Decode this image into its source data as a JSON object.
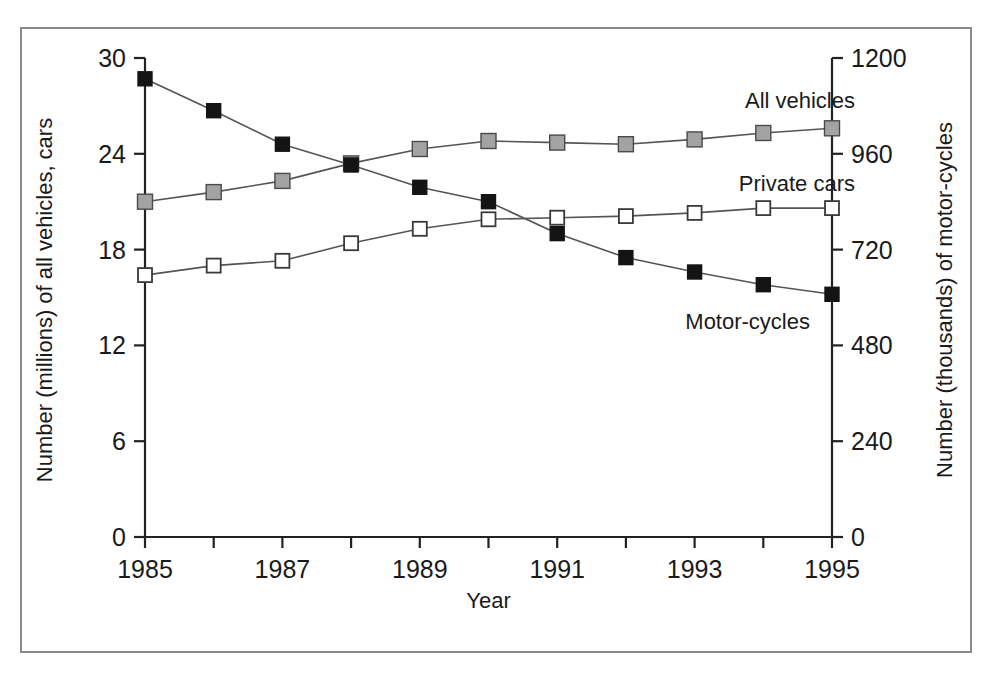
{
  "figure": {
    "clipped_top_text": "",
    "clipped_caption_text": ""
  },
  "axes": {
    "left": {
      "title": "Number (millions) of all vehicles, cars",
      "ticks": [
        "0",
        "6",
        "12",
        "18",
        "24",
        "30"
      ],
      "min": 0,
      "max": 30
    },
    "right": {
      "title": "Number (thousands) of motor-cycles",
      "ticks": [
        "0",
        "240",
        "480",
        "720",
        "960",
        "1200"
      ],
      "min": 0,
      "max": 1200
    },
    "bottom": {
      "title": "Year",
      "ticks": [
        "1985",
        "",
        "1987",
        "",
        "1989",
        "",
        "1991",
        "",
        "1993",
        "",
        "1995"
      ],
      "labels": [
        "1985",
        "1987",
        "1989",
        "1991",
        "1993",
        "1995"
      ]
    }
  },
  "series_labels": {
    "all_vehicles": "All vehicles",
    "private_cars": "Private cars",
    "motor_cycles": "Motor-cycles"
  },
  "colors": {
    "all_vehicles_marker": "#a3a3a3",
    "private_cars_marker": "#ffffff",
    "motor_cycles_marker": "#141414",
    "line": "#555555",
    "axis": "#222222",
    "frame": "#8a8a8a"
  },
  "chart_data": {
    "type": "line",
    "title": "",
    "xlabel": "Year",
    "ylabel": "Number (millions) of all vehicles, cars",
    "y2label": "Number (thousands) of motor-cycles",
    "x": [
      1985,
      1986,
      1987,
      1988,
      1989,
      1990,
      1991,
      1992,
      1993,
      1994,
      1995
    ],
    "xlim": [
      1985,
      1995
    ],
    "ylim": [
      0,
      30
    ],
    "y2lim": [
      0,
      1200
    ],
    "grid": false,
    "legend": "inline-labels",
    "series": [
      {
        "name": "All vehicles",
        "axis": "left",
        "marker": "filled-gray-square",
        "values": [
          21.0,
          21.6,
          22.3,
          23.4,
          24.3,
          24.8,
          24.7,
          24.6,
          24.9,
          25.3,
          25.6
        ]
      },
      {
        "name": "Private cars",
        "axis": "left",
        "marker": "open-white-square",
        "values": [
          16.4,
          17.0,
          17.3,
          18.4,
          19.3,
          19.9,
          20.0,
          20.1,
          20.3,
          20.6,
          20.6
        ]
      },
      {
        "name": "Motor-cycles",
        "axis": "right",
        "marker": "filled-black-square",
        "values": [
          1148,
          1068,
          984,
          932,
          876,
          840,
          760,
          700,
          664,
          632,
          608
        ]
      }
    ]
  }
}
